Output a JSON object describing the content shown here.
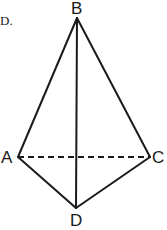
{
  "option_label": "D.",
  "diagram": {
    "type": "tetrahedron",
    "vertices": {
      "B": {
        "label": "B",
        "x": 77,
        "y": 18
      },
      "A": {
        "label": "A",
        "x": 18,
        "y": 157
      },
      "C": {
        "label": "C",
        "x": 150,
        "y": 157
      },
      "D": {
        "label": "D",
        "x": 76,
        "y": 208
      }
    },
    "edges_solid": [
      "BA",
      "BC",
      "BD",
      "AD",
      "CD"
    ],
    "edges_dashed": [
      "AC"
    ],
    "stroke_color": "#1a1a1a"
  }
}
